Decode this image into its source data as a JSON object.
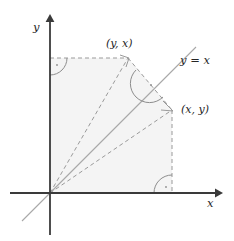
{
  "figure": {
    "axes": {
      "x_label": "x",
      "y_label": "y"
    },
    "line_label": "y = x",
    "points": [
      {
        "id": "reflected",
        "label": "(y, x)",
        "x": 128,
        "y": 58
      },
      {
        "id": "original",
        "label": "(x, y)",
        "x": 172,
        "y": 110
      }
    ],
    "origin": {
      "x": 50,
      "y": 193
    },
    "colors": {
      "axis": "#3a3a3a",
      "dashed": "#9a9a9a",
      "line": "#a8a8a8",
      "fill": "#f4f4f4",
      "arc": "#8d8d8d",
      "text": "#262626"
    }
  }
}
